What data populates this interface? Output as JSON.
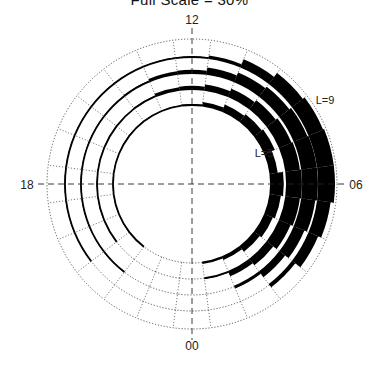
{
  "chart_data": {
    "type": "polar-bar",
    "title": "Full Scale = 30%",
    "full_scale_percent": 30,
    "hour_labels": {
      "top": "12",
      "right": "06",
      "bottom": "00",
      "left": "18"
    },
    "ring_labels": [
      {
        "text": "L=5",
        "ring_index": 0
      },
      {
        "text": "L=9",
        "ring_index": 4
      }
    ],
    "sectors_per_ring": 24,
    "hours": [
      0,
      1,
      2,
      3,
      4,
      5,
      6,
      7,
      8,
      9,
      10,
      11,
      12,
      13,
      14,
      15,
      16,
      17,
      18,
      19,
      20,
      21,
      22,
      23
    ],
    "rings": [
      {
        "name": "L=5",
        "values": [
          0,
          3,
          6,
          12,
          16,
          20,
          24,
          14,
          20,
          17,
          13,
          7,
          2,
          1,
          1,
          1,
          1,
          1,
          1,
          1,
          1,
          1,
          0,
          0
        ]
      },
      {
        "name": "L=6",
        "values": [
          0,
          2,
          9,
          14,
          22,
          26,
          28,
          26,
          24,
          20,
          15,
          10,
          6,
          5,
          2,
          1,
          1,
          1,
          1,
          1,
          1,
          0,
          0,
          0
        ]
      },
      {
        "name": "L=7",
        "values": [
          0,
          0,
          4,
          12,
          20,
          25,
          28,
          28,
          26,
          22,
          18,
          12,
          6,
          5,
          2,
          1,
          1,
          1,
          1,
          1,
          1,
          1,
          0,
          0
        ]
      },
      {
        "name": "L=8",
        "values": [
          0,
          0,
          0,
          6,
          18,
          24,
          30,
          30,
          28,
          24,
          15,
          5,
          1,
          1,
          1,
          1,
          1,
          1,
          1,
          1,
          1,
          0,
          0,
          0
        ]
      },
      {
        "name": "L=9",
        "values": [
          0,
          0,
          0,
          0,
          0,
          0,
          0,
          0,
          0,
          0,
          0,
          0,
          0,
          0,
          0,
          0,
          0,
          0,
          0,
          0,
          0,
          0,
          0,
          0
        ]
      }
    ],
    "ring_radii_px": [
      79,
      95,
      111,
      127,
      145
    ],
    "center_px": [
      192,
      184
    ],
    "grid": true,
    "legend": "none"
  }
}
